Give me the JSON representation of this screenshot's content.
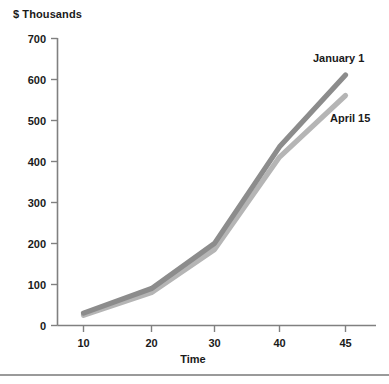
{
  "chart_data": {
    "type": "line",
    "title": "$ Thousands",
    "xlabel": "Time",
    "ylabel": "",
    "categories": [
      "10",
      "20",
      "30",
      "40",
      "45"
    ],
    "x": [
      10,
      20,
      30,
      40,
      45
    ],
    "ylim": [
      0,
      700
    ],
    "yticks": [
      0,
      100,
      200,
      300,
      400,
      500,
      600,
      700
    ],
    "ytick_labels": [
      "0",
      "100",
      "200",
      "300",
      "400",
      "500",
      "600",
      "700"
    ],
    "xtick_labels": [
      "10",
      "20",
      "30",
      "40",
      "45"
    ],
    "grid": false,
    "legend_position": "inline-right",
    "series": [
      {
        "name": "January 1",
        "color": "#8c8c8c",
        "values": [
          30,
          90,
          200,
          435,
          610
        ]
      },
      {
        "name": "April 15",
        "color": "#b5b5b5",
        "values": [
          25,
          80,
          185,
          410,
          560
        ]
      }
    ]
  },
  "axis": {
    "y_ticks": [
      {
        "label": "700"
      },
      {
        "label": "600"
      },
      {
        "label": "500"
      },
      {
        "label": "400"
      },
      {
        "label": "300"
      },
      {
        "label": "200"
      },
      {
        "label": "100"
      },
      {
        "label": "0"
      }
    ],
    "x_ticks": [
      {
        "label": "10"
      },
      {
        "label": "20"
      },
      {
        "label": "30"
      },
      {
        "label": "40"
      },
      {
        "label": "45"
      }
    ]
  },
  "labels": {
    "series_january": "January 1",
    "series_april": "April 15",
    "x_axis_title": "Time",
    "y_axis_title": "$ Thousands"
  }
}
